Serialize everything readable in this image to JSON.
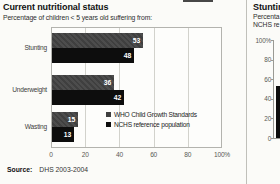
{
  "left_panel": {
    "title": "Current nutritional status",
    "subtitle": "Percentage of children < 5 years old suffering from:",
    "source_label": "Source:",
    "source_value": "DHS 2003-2004"
  },
  "right_panel": {
    "title": "Stunting",
    "subtitle_line1": "Percenta",
    "subtitle_line2": "NCHS re"
  },
  "chart_data": [
    {
      "type": "bar",
      "orientation": "horizontal",
      "title": "Current nutritional status",
      "subtitle": "Percentage of children < 5 years old suffering from:",
      "categories": [
        "Stunting",
        "Underweight",
        "Wasting"
      ],
      "series": [
        {
          "name": "WHO Child Growth Standards",
          "values": [
            53,
            36,
            15
          ],
          "color": "#3f3f3f"
        },
        {
          "name": "NCHS reference population",
          "values": [
            48,
            42,
            13
          ],
          "color": "#0d0d0d"
        }
      ],
      "xlim": [
        0,
        100
      ],
      "xtick_labels": [
        "0",
        "20",
        "40",
        "60",
        "80",
        "100%"
      ],
      "grid": true,
      "value_labels": true,
      "legend_position": "inside-bottom-right",
      "source": "DHS 2003-2004"
    },
    {
      "type": "bar",
      "orientation": "vertical",
      "title": "Stunting",
      "subtitle_lines": [
        "Percenta",
        "NCHS re"
      ],
      "ylim": [
        0,
        100
      ],
      "ytick_labels": [
        "100%",
        "80",
        "60",
        "40",
        "20",
        "0"
      ],
      "values": [
        53
      ],
      "bar_color": "#0d0d0d",
      "clipped_right": true
    }
  ]
}
